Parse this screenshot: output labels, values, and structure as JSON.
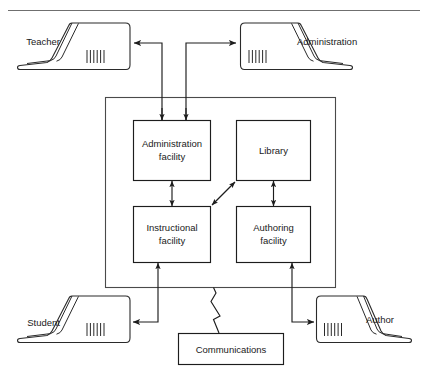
{
  "diagram": {
    "title_rule": "horizontal-rule-top",
    "actors": [
      {
        "id": "teacher",
        "label": "Teacher",
        "icon": "terminal-icon",
        "position": "top-left"
      },
      {
        "id": "administration",
        "label": "Administration",
        "icon": "terminal-icon",
        "position": "top-right"
      },
      {
        "id": "student",
        "label": "Student",
        "icon": "terminal-icon",
        "position": "bottom-left"
      },
      {
        "id": "author",
        "label": "Author",
        "icon": "terminal-icon",
        "position": "bottom-right"
      }
    ],
    "system_boundary": {
      "name": "system-boundary-box",
      "facilities": [
        {
          "id": "administration-facility",
          "line1": "Administration",
          "line2": "facility"
        },
        {
          "id": "library",
          "line1": "Library",
          "line2": ""
        },
        {
          "id": "instructional-facility",
          "line1": "Instructional",
          "line2": "facility"
        },
        {
          "id": "authoring-facility",
          "line1": "Authoring",
          "line2": "facility"
        }
      ]
    },
    "external": [
      {
        "id": "communications",
        "label": "Communications",
        "icon": "lightning-bolt-icon"
      }
    ],
    "connections": [
      {
        "from": "administration-facility",
        "to": "teacher",
        "type": "arrow-single"
      },
      {
        "from": "administration-facility",
        "to": "administration",
        "type": "arrow-single"
      },
      {
        "from": "administration-facility",
        "to": "instructional-facility",
        "type": "arrow-double"
      },
      {
        "from": "library",
        "to": "authoring-facility",
        "type": "arrow-double"
      },
      {
        "from": "library",
        "to": "instructional-facility",
        "type": "arrow-double-diagonal"
      },
      {
        "from": "student",
        "to": "instructional-facility",
        "type": "arrow-single"
      },
      {
        "from": "authoring-facility",
        "to": "author",
        "type": "arrow-single"
      },
      {
        "from": "communications",
        "to": "system-boundary",
        "type": "lightning"
      }
    ],
    "colors": {
      "ink": "#1d1d1d",
      "rule": "#6f6f6f",
      "background": "#ffffff",
      "boundary": "#4a4a4a"
    }
  }
}
